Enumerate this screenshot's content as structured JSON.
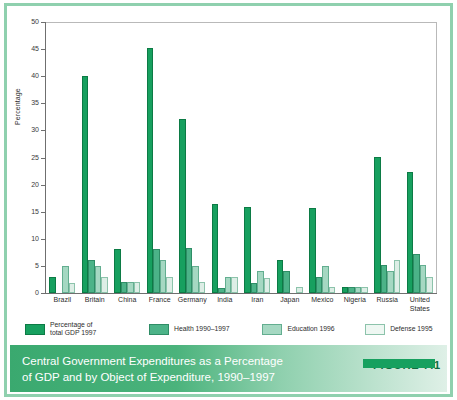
{
  "chart_data": {
    "type": "bar",
    "title": "Central Government Expenditures as a Percentage\nof GDP and by Object of Expenditure, 1990–1997",
    "figure_tag": "FIGURE 7.1",
    "xlabel": "",
    "ylabel": "Percentage",
    "ylim": [
      0,
      50
    ],
    "yticks": [
      0,
      5,
      10,
      15,
      20,
      25,
      30,
      35,
      40,
      45,
      50
    ],
    "grid": false,
    "legend_position": "below-axes",
    "categories": [
      "Brazil",
      "Britain",
      "China",
      "France",
      "Germany",
      "India",
      "Iran",
      "Japan",
      "Mexico",
      "Nigeria",
      "Russia",
      "United\nStates"
    ],
    "series": [
      {
        "name": "Percentage of\ntotal GDP 1997",
        "color": "#17a05f",
        "values": [
          3.0,
          40.1,
          8.1,
          45.2,
          32.1,
          16.4,
          15.8,
          6.1,
          15.7,
          1.1,
          25.1,
          22.3
        ]
      },
      {
        "name": "Health 1990–1997",
        "color": "#4cb388",
        "values": [
          0.0,
          6.0,
          2.0,
          8.2,
          8.3,
          1.0,
          1.8,
          4.0,
          3.0,
          1.1,
          5.1,
          7.2
        ]
      },
      {
        "name": "Education 1996",
        "color": "#a5d8c2",
        "values": [
          5.0,
          5.0,
          2.0,
          6.0,
          5.0,
          3.0,
          4.0,
          0.0,
          5.0,
          1.1,
          4.1,
          5.1
        ]
      },
      {
        "name": "Defense 1995",
        "color": "#ddeee6",
        "values": [
          1.9,
          3.0,
          2.0,
          3.0,
          2.0,
          3.0,
          2.7,
          1.1,
          1.1,
          1.1,
          6.1,
          3.0
        ]
      }
    ]
  },
  "legend": {
    "items": [
      {
        "label": "Percentage of\ntotal GDP 1997",
        "swatch": "total"
      },
      {
        "label": "Health 1990–1997",
        "swatch": "health"
      },
      {
        "label": "Education 1996",
        "swatch": "edu"
      },
      {
        "label": "Defense 1995",
        "swatch": "defense"
      }
    ]
  },
  "colors": {
    "total": "#17a05f",
    "health": "#4cb388",
    "education": "#a5d8c2",
    "defense": "#ddeee6",
    "frame": "#8fd0ae",
    "caption_text": "#ffffff",
    "figure_tag": "#126b3f"
  }
}
